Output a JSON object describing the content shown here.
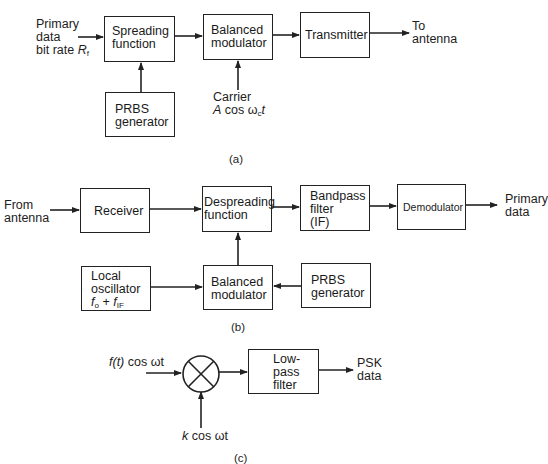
{
  "panel_a": {
    "caption": "(a)",
    "input_label": {
      "line1": "Primary",
      "line2": "data",
      "line3": "bit rate",
      "rate_symbol": "R",
      "rate_sub": "f"
    },
    "spreading": {
      "line1": "Spreading",
      "line2": "function"
    },
    "balanced_modulator": {
      "line1": "Balanced",
      "line2": "modulator"
    },
    "transmitter": "Transmitter",
    "output_label": {
      "line1": "To",
      "line2": "antenna"
    },
    "prbs": {
      "line1": "PRBS",
      "line2": "generator"
    },
    "carrier": {
      "line1": "Carrier",
      "amp": "A",
      "cos": " cos ",
      "omega": "ω",
      "omega_sub": "c",
      "t": "t"
    }
  },
  "panel_b": {
    "caption": "(b)",
    "input_label": {
      "line1": "From",
      "line2": "antenna"
    },
    "receiver": "Receiver",
    "despreading": {
      "line1": "Despreading",
      "line2": "function"
    },
    "bandpass": {
      "line1": "Bandpass",
      "line2": "filter",
      "line3": "(IF)"
    },
    "demodulator": "Demodulator",
    "output_label": {
      "line1": "Primary",
      "line2": "data"
    },
    "local_oscillator": {
      "line1": "Local",
      "line2": "oscillator",
      "f": "f",
      "f_sub": "o",
      "plus": " + ",
      "f2": "f",
      "f2_sub": "IF"
    },
    "balanced_modulator": {
      "line1": "Balanced",
      "line2": "modulator"
    },
    "prbs": {
      "line1": "PRBS",
      "line2": "generator"
    }
  },
  "panel_c": {
    "caption": "(c)",
    "input_label": {
      "func": "f(t)",
      "rest": " cos ωt"
    },
    "reference_label": {
      "k": "k",
      "rest": " cos ωt"
    },
    "lowpass": {
      "line1": "Low-",
      "line2": "pass",
      "line3": "filter"
    },
    "output_label": {
      "line1": "PSK",
      "line2": "data"
    }
  }
}
